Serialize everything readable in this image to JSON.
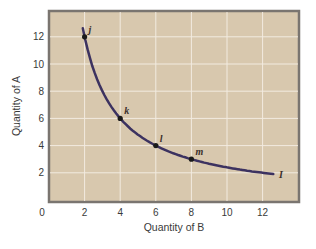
{
  "chart_data": {
    "type": "line",
    "title": "",
    "xlabel": "Quantity of B",
    "ylabel": "Quantity of A",
    "xlim": [
      0,
      13.9
    ],
    "ylim": [
      0,
      14.4
    ],
    "x_ticks": [
      "0",
      "2",
      "4",
      "6",
      "8",
      "10",
      "12"
    ],
    "y_ticks": [
      "2",
      "4",
      "6",
      "8",
      "10",
      "12"
    ],
    "grid": true,
    "legend": null,
    "series": [
      {
        "name": "I",
        "description": "Indifference curve (A = 24 / B)",
        "x": [
          1.9,
          2,
          3,
          4,
          5,
          6,
          7,
          8,
          9,
          10,
          11,
          12,
          12.6
        ],
        "y": [
          12.6,
          12,
          8,
          6,
          4.8,
          4,
          3.43,
          3,
          2.67,
          2.4,
          2.18,
          2,
          1.9
        ]
      }
    ],
    "points": [
      {
        "label": "j",
        "x": 2,
        "y": 12
      },
      {
        "label": "k",
        "x": 4,
        "y": 6
      },
      {
        "label": "l",
        "x": 6,
        "y": 4
      },
      {
        "label": "m",
        "x": 8,
        "y": 3
      }
    ],
    "annotations": [
      {
        "text": "I",
        "x": 12.7,
        "y": 1.9,
        "note": "curve label"
      }
    ],
    "colors": {
      "plot_background": "#d8c8ae",
      "grid": "#f2ebe0",
      "frame": "#7a7570",
      "curve": "#3c3260",
      "points": "#1a1a1a"
    }
  }
}
